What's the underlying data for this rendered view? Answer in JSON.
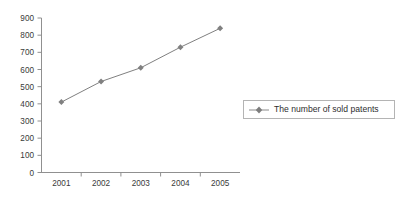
{
  "chart_data": {
    "type": "line",
    "title": "",
    "subtitle": "",
    "xlabel": "",
    "ylabel": "",
    "categories": [
      "2001",
      "2002",
      "2003",
      "2004",
      "2005"
    ],
    "series": [
      {
        "name": "The number of sold patents",
        "values": [
          410,
          530,
          610,
          730,
          840
        ],
        "color": "#808080",
        "marker": "diamond"
      }
    ],
    "ylim": [
      0,
      900
    ],
    "ytick_step": 100,
    "ytick_labels": [
      "0",
      "100",
      "200",
      "300",
      "400",
      "500",
      "600",
      "700",
      "800",
      "900"
    ],
    "grid": false,
    "legend_position": "right",
    "axis_color": "#808080"
  },
  "legend": {
    "entries": [
      {
        "label": "The number of sold patents"
      }
    ]
  },
  "axes": {
    "x_tick_labels": [
      "2001",
      "2002",
      "2003",
      "2004",
      "2005"
    ],
    "y_tick_labels": [
      "0",
      "100",
      "200",
      "300",
      "400",
      "500",
      "600",
      "700",
      "800",
      "900"
    ]
  }
}
